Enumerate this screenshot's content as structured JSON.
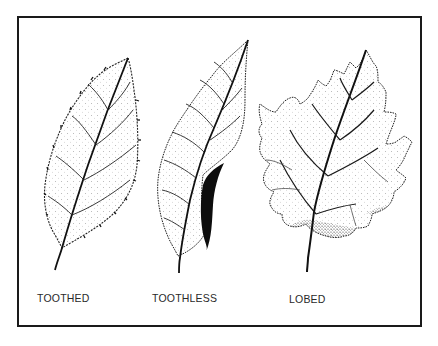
{
  "figure": {
    "border_color": "#1a1a1a",
    "ink_color": "#111111",
    "leaves": [
      {
        "id": "toothed",
        "label": "TOOTHED"
      },
      {
        "id": "toothless",
        "label": "TOOTHLESS"
      },
      {
        "id": "lobed",
        "label": "LOBED"
      }
    ]
  }
}
